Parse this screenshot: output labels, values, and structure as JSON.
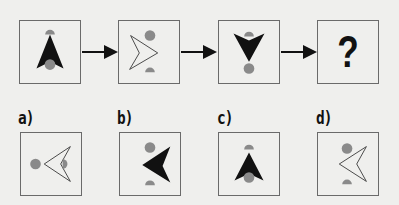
{
  "puzzle": {
    "sequence": [
      {
        "id": "step-1",
        "figure": "filled-arrowhead-up",
        "top": "half-circle",
        "bottom": "circle"
      },
      {
        "id": "step-2",
        "figure": "outline-arrowhead-right",
        "top": "circle",
        "bottom": "half-circle"
      },
      {
        "id": "step-3",
        "figure": "filled-arrowhead-down",
        "top": "half-circle",
        "bottom": "circle"
      },
      {
        "id": "step-4",
        "figure": "unknown",
        "text": "?"
      }
    ],
    "options": [
      {
        "label": "a)",
        "figure": "outline-arrowhead-left",
        "left": "circle",
        "right": "half-circle"
      },
      {
        "label": "b)",
        "figure": "filled-arrowhead-left",
        "top": "circle",
        "bottom": "half-circle"
      },
      {
        "label": "c)",
        "figure": "filled-arrowhead-up",
        "top": "half-circle",
        "bottom": "circle"
      },
      {
        "label": "d)",
        "figure": "outline-arrowhead-left",
        "top": "circle",
        "bottom": "half-circle"
      }
    ]
  },
  "colors": {
    "background": "#efefed",
    "border": "#6a6a6a",
    "figure": "#111111",
    "dot": "#8a8a8a"
  }
}
